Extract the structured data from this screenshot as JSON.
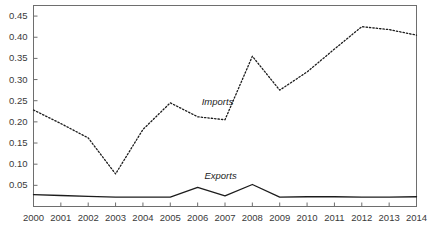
{
  "chart_data": {
    "type": "line",
    "title": "",
    "subtitle": "",
    "xlabel": "",
    "ylabel": "",
    "grid": false,
    "legend_position": "inline-annotation",
    "x": [
      2000,
      2001,
      2002,
      2003,
      2004,
      2005,
      2006,
      2007,
      2008,
      2009,
      2010,
      2011,
      2012,
      2013,
      2014
    ],
    "xtick_labels": [
      "2000",
      "2001",
      "2002",
      "2003",
      "2004",
      "2005",
      "2006",
      "2007",
      "2008",
      "2009",
      "2010",
      "2011",
      "2012",
      "2013",
      "2014"
    ],
    "ytick_labels": [
      "0.05",
      "0.10",
      "0.15",
      "0.20",
      "0.25",
      "0.30",
      "0.35",
      "0.40",
      "0.45"
    ],
    "ytick_values": [
      0.05,
      0.1,
      0.15,
      0.2,
      0.25,
      0.3,
      0.35,
      0.4,
      0.45
    ],
    "xlim": [
      2000,
      2014
    ],
    "ylim": [
      0.0,
      0.475
    ],
    "series": [
      {
        "name": "Imports",
        "style": "dotted",
        "color": "#1c1c1c",
        "values": [
          0.228,
          0.196,
          0.162,
          0.077,
          0.182,
          0.245,
          0.212,
          0.205,
          0.355,
          0.275,
          0.318,
          0.372,
          0.425,
          0.418,
          0.405
        ]
      },
      {
        "name": "Exports",
        "style": "solid",
        "color": "#1c1c1c",
        "values": [
          0.028,
          0.026,
          0.024,
          0.022,
          0.022,
          0.022,
          0.045,
          0.025,
          0.052,
          0.022,
          0.023,
          0.023,
          0.022,
          0.022,
          0.023
        ]
      }
    ],
    "annotations": [
      {
        "text": "Imports",
        "x": 2006.15,
        "y": 0.248
      },
      {
        "text": "Exports",
        "x": 2006.25,
        "y": 0.072
      }
    ],
    "colors": {
      "axis": "#6e6e6e",
      "tick_label": "#3a3a3a",
      "line": "#1c1c1c",
      "background": "#ffffff"
    }
  }
}
